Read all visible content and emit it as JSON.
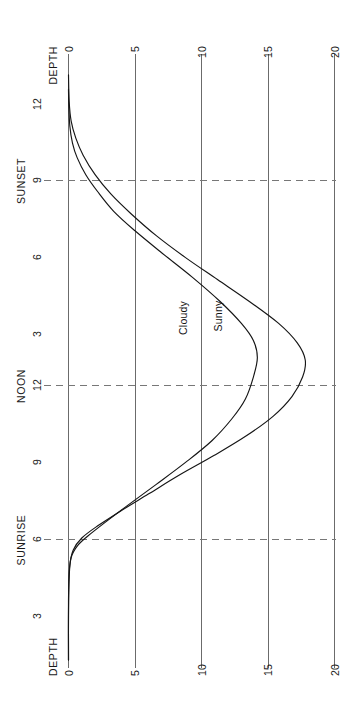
{
  "figure": {
    "orientation": "rotated-90",
    "background_color": "#ffffff",
    "line_color": "#151515",
    "grid_color": "#6b6b6b",
    "event_line_color": "#777777"
  },
  "chart_data": {
    "type": "line",
    "title": "",
    "xlabel": "DEPTH",
    "ylabel": "",
    "axis_titles": {
      "top": "DEPTH",
      "bottom": "DEPTH"
    },
    "depth_ticks": [
      0,
      5,
      10,
      15,
      20
    ],
    "depth_tick_labels": [
      "0",
      "5",
      "10",
      "15",
      "20"
    ],
    "depth_axis_range": [
      0,
      20
    ],
    "time_tick_labels": [
      "12",
      "9",
      "6",
      "3",
      "12",
      "9",
      "6",
      "3"
    ],
    "time_tick_hours": [
      24,
      21,
      18,
      15,
      12,
      9,
      6,
      3
    ],
    "time_axis_range": [
      1.2,
      25.2
    ],
    "event_markers": [
      {
        "label": "SUNSET",
        "hour": 20.3
      },
      {
        "label": "NOON",
        "hour": 12.0
      },
      {
        "label": "SUNRISE",
        "hour": 6.3
      }
    ],
    "grid": "depth gridlines only",
    "legend": "inline curve labels",
    "series": [
      {
        "name": "Cloudy",
        "label": "Cloudy",
        "points": [
          {
            "hour": 1.2,
            "depth": 0.0
          },
          {
            "hour": 3.0,
            "depth": 0.0
          },
          {
            "hour": 4.6,
            "depth": 0.05
          },
          {
            "hour": 5.4,
            "depth": 0.2
          },
          {
            "hour": 5.9,
            "depth": 0.7
          },
          {
            "hour": 6.3,
            "depth": 1.5
          },
          {
            "hour": 6.9,
            "depth": 2.9
          },
          {
            "hour": 7.6,
            "depth": 4.6
          },
          {
            "hour": 8.4,
            "depth": 6.6
          },
          {
            "hour": 9.3,
            "depth": 8.8
          },
          {
            "hour": 10.2,
            "depth": 10.8
          },
          {
            "hour": 11.1,
            "depth": 12.3
          },
          {
            "hour": 11.9,
            "depth": 13.3
          },
          {
            "hour": 12.8,
            "depth": 13.9
          },
          {
            "hour": 13.6,
            "depth": 14.2
          },
          {
            "hour": 14.3,
            "depth": 13.9
          },
          {
            "hour": 15.0,
            "depth": 13.0
          },
          {
            "hour": 15.9,
            "depth": 11.4
          },
          {
            "hour": 16.9,
            "depth": 9.3
          },
          {
            "hour": 17.9,
            "depth": 7.0
          },
          {
            "hour": 18.8,
            "depth": 5.0
          },
          {
            "hour": 19.6,
            "depth": 3.4
          },
          {
            "hour": 20.4,
            "depth": 2.2
          },
          {
            "hour": 21.1,
            "depth": 1.3
          },
          {
            "hour": 21.8,
            "depth": 0.65
          },
          {
            "hour": 22.4,
            "depth": 0.3
          },
          {
            "hour": 23.1,
            "depth": 0.1
          },
          {
            "hour": 24.0,
            "depth": 0.02
          },
          {
            "hour": 24.6,
            "depth": 0.0
          }
        ]
      },
      {
        "name": "Sunny",
        "label": "Sunny",
        "points": [
          {
            "hour": 1.2,
            "depth": 0.0
          },
          {
            "hour": 3.6,
            "depth": 0.0
          },
          {
            "hour": 5.0,
            "depth": 0.08
          },
          {
            "hour": 5.7,
            "depth": 0.35
          },
          {
            "hour": 6.2,
            "depth": 1.0
          },
          {
            "hour": 6.7,
            "depth": 2.2
          },
          {
            "hour": 7.3,
            "depth": 3.9
          },
          {
            "hour": 8.0,
            "depth": 6.0
          },
          {
            "hour": 8.8,
            "depth": 8.4
          },
          {
            "hour": 9.6,
            "depth": 11.0
          },
          {
            "hour": 10.4,
            "depth": 13.4
          },
          {
            "hour": 11.2,
            "depth": 15.4
          },
          {
            "hour": 12.0,
            "depth": 16.8
          },
          {
            "hour": 12.8,
            "depth": 17.6
          },
          {
            "hour": 13.5,
            "depth": 17.8
          },
          {
            "hour": 14.2,
            "depth": 17.2
          },
          {
            "hour": 15.0,
            "depth": 15.8
          },
          {
            "hour": 15.9,
            "depth": 13.6
          },
          {
            "hour": 16.8,
            "depth": 11.2
          },
          {
            "hour": 17.7,
            "depth": 8.8
          },
          {
            "hour": 18.6,
            "depth": 6.6
          },
          {
            "hour": 19.5,
            "depth": 4.7
          },
          {
            "hour": 20.3,
            "depth": 3.2
          },
          {
            "hour": 21.1,
            "depth": 2.0
          },
          {
            "hour": 21.9,
            "depth": 1.1
          },
          {
            "hour": 22.6,
            "depth": 0.55
          },
          {
            "hour": 23.3,
            "depth": 0.2
          },
          {
            "hour": 24.1,
            "depth": 0.05
          },
          {
            "hour": 25.2,
            "depth": 0.0
          }
        ]
      }
    ]
  }
}
